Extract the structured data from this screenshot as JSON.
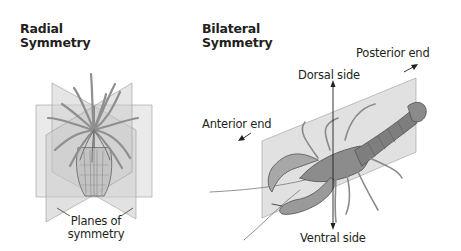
{
  "radial": {
    "title_line1": "Radial",
    "title_line2": "Symmetry",
    "planes_label_line1": "Planes of",
    "planes_label_line2": "symmetry"
  },
  "bilateral": {
    "title_line1": "Bilateral",
    "title_line2": "Symmetry",
    "posterior_label": "Posterior end",
    "dorsal_label": "Dorsal side",
    "anterior_label": "Anterior end",
    "ventral_label": "Ventral side"
  },
  "colors": {
    "plane_fill": "#d4d4d4",
    "plane_edge": "#8a8a8a",
    "organism": "#6b6b6b",
    "text": "#231f20"
  }
}
